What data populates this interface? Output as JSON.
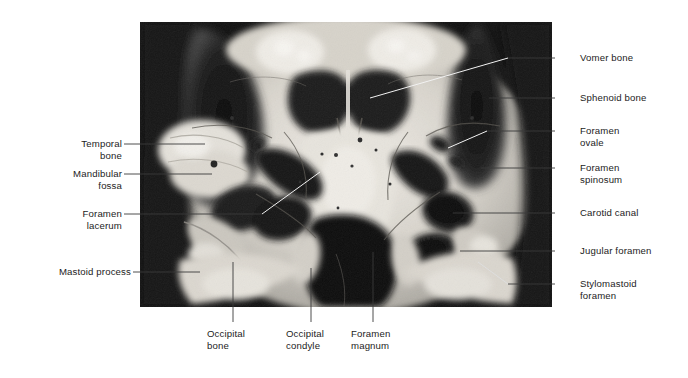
{
  "figure": {
    "kind": "anatomical-photograph",
    "view": "inferior view of the skull base",
    "background_color": "#ffffff",
    "photo": {
      "x": 140,
      "y": 22,
      "width": 412,
      "height": 285,
      "tone": "black-and-white",
      "dark_color": "#111111",
      "mid_color": "#8d8d8d",
      "light_color": "#e9e7e2"
    }
  },
  "labels": {
    "left": [
      {
        "id": "temporal-bone",
        "text": "Temporal\nbone",
        "x": 62,
        "y": 138,
        "lines": 2,
        "leader": {
          "x1": 124,
          "y1": 144,
          "x2": 205,
          "y2": 144
        }
      },
      {
        "id": "mandibular-fossa",
        "text": "Mandibular\nfossa",
        "x": 55,
        "y": 168,
        "lines": 2,
        "leader": {
          "x1": 124,
          "y1": 174,
          "x2": 212,
          "y2": 174
        }
      },
      {
        "id": "foramen-lacerum",
        "text": "Foramen\nlacerum",
        "x": 67,
        "y": 208,
        "lines": 2,
        "leader": {
          "x1": 124,
          "y1": 214,
          "x2": 262,
          "y2": 214
        }
      },
      {
        "id": "mastoid-process",
        "text": "Mastoid process",
        "x": 33,
        "y": 266,
        "lines": 1,
        "leader": {
          "x1": 133,
          "y1": 272,
          "x2": 200,
          "y2": 272
        }
      }
    ],
    "right": [
      {
        "id": "vomer-bone",
        "text": "Vomer bone",
        "x": 580,
        "y": 52,
        "lines": 1,
        "leader": {
          "x1": 555,
          "y1": 58,
          "x2": 508,
          "y2": 58
        }
      },
      {
        "id": "sphenoid-bone",
        "text": "Sphenoid bone",
        "x": 580,
        "y": 92,
        "lines": 1,
        "leader": {
          "x1": 555,
          "y1": 98,
          "x2": 489,
          "y2": 98
        }
      },
      {
        "id": "foramen-ovale",
        "text": "Foramen\novale",
        "x": 580,
        "y": 125,
        "lines": 2,
        "leader": {
          "x1": 555,
          "y1": 131,
          "x2": 487,
          "y2": 131
        }
      },
      {
        "id": "foramen-spinosum",
        "text": "Foramen\nspinosum",
        "x": 580,
        "y": 162,
        "lines": 2,
        "leader": {
          "x1": 555,
          "y1": 168,
          "x2": 481,
          "y2": 168
        }
      },
      {
        "id": "carotid-canal",
        "text": "Carotid canal",
        "x": 580,
        "y": 207,
        "lines": 1,
        "leader": {
          "x1": 555,
          "y1": 213,
          "x2": 453,
          "y2": 213
        }
      },
      {
        "id": "jugular-foramen",
        "text": "Jugular foramen",
        "x": 580,
        "y": 245,
        "lines": 1,
        "leader": {
          "x1": 555,
          "y1": 251,
          "x2": 460,
          "y2": 251
        }
      },
      {
        "id": "stylomastoid-foramen",
        "text": "Stylomastoid\nforamen",
        "x": 580,
        "y": 278,
        "lines": 2,
        "leader": {
          "x1": 555,
          "y1": 284,
          "x2": 508,
          "y2": 284
        }
      }
    ],
    "bottom": [
      {
        "id": "occipital-bone",
        "text": "Occipital\nbone",
        "x": 207,
        "y": 328,
        "lines": 2,
        "leader": {
          "x1": 233,
          "y1": 322,
          "x2": 233,
          "y2": 262
        }
      },
      {
        "id": "occipital-condyle",
        "text": "Occipital\ncondyle",
        "x": 286,
        "y": 328,
        "lines": 2,
        "leader": {
          "x1": 311,
          "y1": 322,
          "x2": 311,
          "y2": 268
        }
      },
      {
        "id": "foramen-magnum",
        "text": "Foramen\nmagnum",
        "x": 351,
        "y": 328,
        "lines": 2,
        "leader": {
          "x1": 373,
          "y1": 322,
          "x2": 373,
          "y2": 252
        }
      }
    ],
    "in_photo_leaders": [
      {
        "id": "vomer-pointer",
        "x1": 508,
        "y1": 58,
        "x2": 370,
        "y2": 98
      },
      {
        "id": "foramen-ovale-pointer",
        "x1": 487,
        "y1": 131,
        "x2": 448,
        "y2": 148
      },
      {
        "id": "lacerum-pointer",
        "x1": 262,
        "y1": 214,
        "x2": 320,
        "y2": 172
      },
      {
        "id": "stylomastoid-pointer",
        "x1": 508,
        "y1": 284,
        "x2": 478,
        "y2": 262
      }
    ]
  },
  "colors": {
    "leader_line": "#3a3a3a",
    "leader_line_on_photo": "#f2f2f2",
    "text": "#1c1c1c",
    "page_background": "#ffffff"
  }
}
